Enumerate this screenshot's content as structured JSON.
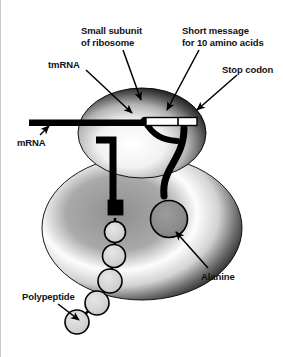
{
  "figure": {
    "background_color": "#ffffff",
    "width": 283,
    "height": 357
  },
  "labels": {
    "small_subunit": "Small subunit\nof ribosome",
    "short_message": "Short message\nfor 10 amino acids",
    "tmrna": "tmRNA",
    "stop_codon": "Stop codon",
    "mrna": "mRNA",
    "alanine": "Alanine",
    "polypeptide": "Polypeptide"
  },
  "colors": {
    "outline": "#000000",
    "label_text": "#111111",
    "subunit_dark": "#2b2b2b",
    "subunit_mid": "#7d7d7d",
    "subunit_light": "#ffffff",
    "alanine_fill": "#8d8d8d",
    "polypeptide_fill": "#d2d2d2",
    "message_fill": "#ffffff",
    "mrna_fill": "#000000"
  },
  "parts": {
    "small_subunit": {
      "name": "small subunit of ribosome",
      "shape": "dome"
    },
    "large_subunit": {
      "name": "large subunit of ribosome",
      "shape": "ellipse"
    },
    "mrna_strand": {
      "name": "mRNA",
      "shape": "horizontal bar"
    },
    "message_box": {
      "name": "short message for 10 amino acids",
      "shape": "rectangle"
    },
    "stop_codon_box": {
      "name": "stop codon",
      "shape": "rectangle"
    },
    "tmrna_strand": {
      "name": "tmRNA",
      "shape": "bent tube"
    },
    "alanine_residue": {
      "name": "alanine",
      "shape": "circle"
    },
    "black_square": {
      "name": "tmRNA terminus",
      "shape": "square"
    },
    "polypeptide_chain": {
      "name": "polypeptide",
      "shape": "chain of circles",
      "residue_count": 6
    }
  }
}
